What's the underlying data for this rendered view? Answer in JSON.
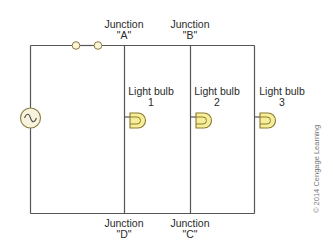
{
  "diagram": {
    "type": "parallel circuit",
    "colors": {
      "wire": "#555555",
      "bulb_fill": "#f7ee9a",
      "bulb_stroke": "#8a7a30",
      "source_fill": "#f8f3dc",
      "source_stroke": "#8a7a40",
      "terminal_fill": "#fbf6d8"
    },
    "junctions": [
      {
        "id": "A",
        "label": "Junction",
        "name": "\"A\""
      },
      {
        "id": "B",
        "label": "Junction",
        "name": "\"B\""
      },
      {
        "id": "C",
        "label": "Junction",
        "name": "\"C\""
      },
      {
        "id": "D",
        "label": "Junction",
        "name": "\"D\""
      }
    ],
    "bulbs": [
      {
        "label": "Light bulb",
        "number": "1"
      },
      {
        "label": "Light bulb",
        "number": "2"
      },
      {
        "label": "Light bulb",
        "number": "3"
      }
    ],
    "source": {
      "symbol": "AC source (~)"
    },
    "credit": "© 2014 Cengage Learning"
  }
}
